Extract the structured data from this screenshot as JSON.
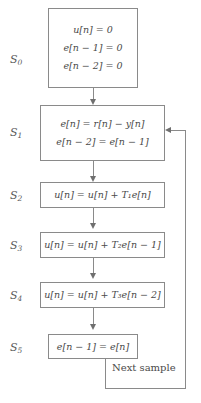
{
  "diagram": {
    "type": "flowchart",
    "states": [
      {
        "id": "S0",
        "label": "S",
        "sub": "0",
        "equations": [
          {
            "lhs": "u[n]",
            "op": "=",
            "rhs": "0",
            "text": "u[n] = 0"
          },
          {
            "lhs": "e[n − 1]",
            "op": "=",
            "rhs": "0",
            "text": "e[n − 1] = 0"
          },
          {
            "lhs": "e[n − 2]",
            "op": "=",
            "rhs": "0",
            "text": "e[n − 2] = 0"
          }
        ]
      },
      {
        "id": "S1",
        "label": "S",
        "sub": "1",
        "equations": [
          {
            "text": "e[n] = r[n] − y[n]"
          },
          {
            "text": "e[n − 2] = e[n − 1]"
          }
        ]
      },
      {
        "id": "S2",
        "label": "S",
        "sub": "2",
        "equations": [
          {
            "text": "u[n] = u[n] + T₁e[n]",
            "coefficient": "T1"
          }
        ]
      },
      {
        "id": "S3",
        "label": "S",
        "sub": "3",
        "equations": [
          {
            "text": "u[n] = u[n] + T₂e[n − 1]",
            "coefficient": "T2"
          }
        ]
      },
      {
        "id": "S4",
        "label": "S",
        "sub": "4",
        "equations": [
          {
            "text": "u[n] = u[n] + T₃e[n − 2]",
            "coefficient": "T3"
          }
        ]
      },
      {
        "id": "S5",
        "label": "S",
        "sub": "5",
        "equations": [
          {
            "text": "e[n − 1] = e[n]"
          }
        ]
      }
    ],
    "feedback_label": "Next sample",
    "colors": {
      "border": "#8a8a8a",
      "text": "#4a4a4a",
      "arrow": "#6f6f6f",
      "background": "#ffffff"
    }
  }
}
